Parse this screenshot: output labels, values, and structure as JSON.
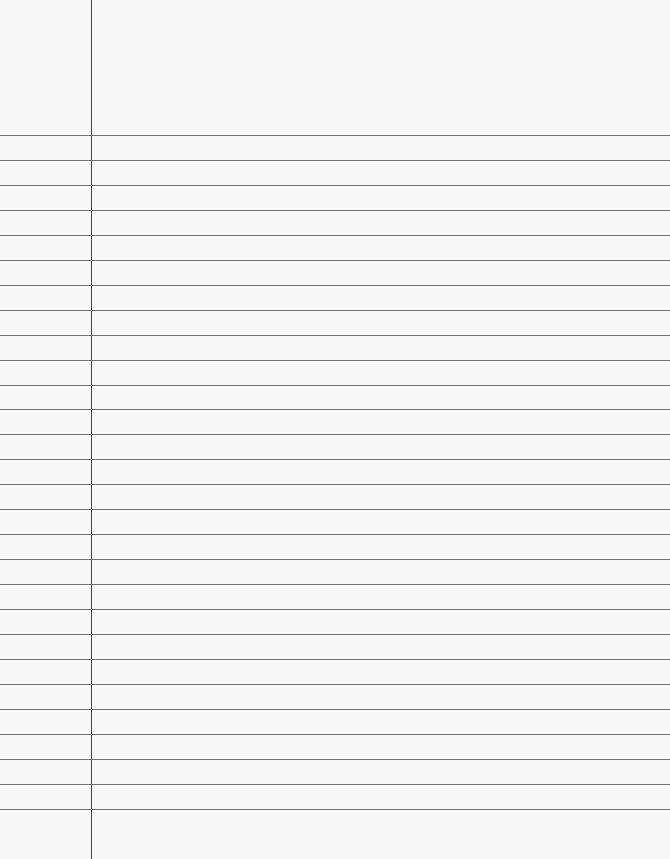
{
  "paper": {
    "type": "lined-paper",
    "background": "#f7f7f5",
    "line_color": "#5a5a5a",
    "margin_line_x": 91,
    "first_line_y": 135,
    "line_spacing": 24.95,
    "line_count": 28
  }
}
